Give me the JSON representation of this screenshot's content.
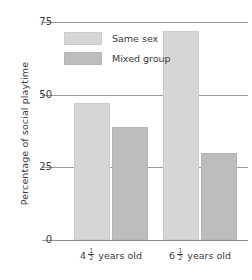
{
  "chart_data": {
    "type": "bar",
    "title": "",
    "xlabel": "",
    "ylabel": "Percentage of social playtime",
    "ylim": [
      0,
      75
    ],
    "yticks": [
      0,
      25,
      50,
      75
    ],
    "ytick_labels": [
      "0",
      "25",
      "50",
      "75"
    ],
    "grid": true,
    "legend_position": "upper-left-inside",
    "categories": [
      "4½ years old",
      "6½ years old"
    ],
    "category_parts": [
      {
        "whole": "4",
        "numerator": "1",
        "denominator": "2",
        "suffix": "years old"
      },
      {
        "whole": "6",
        "numerator": "1",
        "denominator": "2",
        "suffix": "years old"
      }
    ],
    "series": [
      {
        "name": "Same sex",
        "color": "#d6d6d6",
        "values": [
          47,
          72
        ]
      },
      {
        "name": "Mixed group",
        "color": "#bdbdbd",
        "values": [
          39,
          30
        ]
      }
    ]
  },
  "legend": {
    "items": [
      {
        "label": "Same sex",
        "swatch": "same"
      },
      {
        "label": "Mixed group",
        "swatch": "mixed"
      }
    ]
  }
}
